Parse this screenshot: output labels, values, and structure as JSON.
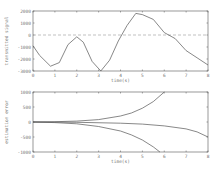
{
  "chart_data": [
    {
      "type": "line",
      "title": "",
      "xlabel": "time(s)",
      "ylabel": "transmitted signal",
      "xlim": [
        0,
        8
      ],
      "ylim": [
        -3000,
        2000
      ],
      "xticks": [
        0,
        1,
        2,
        3,
        4,
        5,
        6,
        7,
        8
      ],
      "yticks": [
        2000,
        1000,
        0,
        -1000,
        -2000,
        -3000
      ],
      "grid": false,
      "reference_line": {
        "y": 0,
        "style": "dashed"
      },
      "series": [
        {
          "name": "signal",
          "x": [
            0,
            0.3,
            0.8,
            1.2,
            1.6,
            2.0,
            2.3,
            2.7,
            3.1,
            3.5,
            3.9,
            4.3,
            4.7,
            5.0,
            5.5,
            6.0,
            6.5,
            7.0,
            7.5,
            8.0
          ],
          "values": [
            -900,
            -1700,
            -2600,
            -2300,
            -800,
            -150,
            -600,
            -2200,
            -3000,
            -2100,
            -500,
            800,
            1800,
            1700,
            1300,
            200,
            -300,
            -1300,
            -1900,
            -2500
          ]
        }
      ]
    },
    {
      "type": "line",
      "title": "",
      "xlabel": "time(s)",
      "ylabel": "estimation error",
      "xlim": [
        0,
        8
      ],
      "ylim": [
        -1000,
        1000
      ],
      "xticks": [
        0,
        1,
        2,
        3,
        4,
        5,
        6,
        7,
        8
      ],
      "yticks": [
        1000,
        500,
        0,
        -500,
        -1000
      ],
      "grid": false,
      "series": [
        {
          "name": "upper bound",
          "x": [
            0,
            1,
            2,
            3,
            4,
            4.5,
            5,
            5.5,
            6.0
          ],
          "values": [
            0,
            10,
            30,
            80,
            200,
            300,
            460,
            680,
            1000
          ]
        },
        {
          "name": "error",
          "x": [
            0,
            2,
            4,
            5,
            6,
            7,
            7.5,
            8
          ],
          "values": [
            0,
            -10,
            -40,
            -70,
            -130,
            -230,
            -330,
            -500
          ]
        },
        {
          "name": "lower bound",
          "x": [
            0,
            1,
            2,
            3,
            4,
            4.5,
            5,
            5.5,
            5.8
          ],
          "values": [
            0,
            -20,
            -60,
            -150,
            -300,
            -430,
            -600,
            -830,
            -1000
          ]
        }
      ]
    }
  ]
}
